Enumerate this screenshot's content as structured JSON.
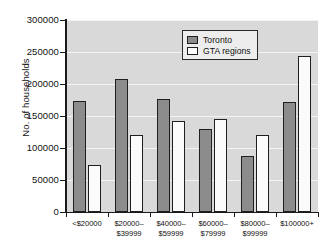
{
  "chart_data": {
    "type": "bar",
    "title": "",
    "subtitle": "",
    "xlabel": "",
    "ylabel": "No. of households",
    "ylim": [
      0,
      300000
    ],
    "ytick_labels": [
      "0",
      "50000",
      "100000",
      "150000",
      "200000",
      "250000",
      "300000"
    ],
    "ytick_values": [
      0,
      50000,
      100000,
      150000,
      200000,
      250000,
      300000
    ],
    "grid": true,
    "legend_position": "top-right",
    "categories": [
      "<$20000",
      "$20000–\n$39999",
      "$40000–\n$59999",
      "$60000–\n$79999",
      "$80000–\n$99999",
      "$100000+"
    ],
    "series": [
      {
        "name": "Toronto",
        "color": "#8c8c8c",
        "values": [
          174000,
          208000,
          176000,
          130000,
          87000,
          172000
        ]
      },
      {
        "name": "GTA regions",
        "color": "#fbfbfb",
        "values": [
          73000,
          121000,
          142000,
          146000,
          120000,
          243000
        ]
      }
    ]
  },
  "legend": {
    "items": [
      {
        "label": "Toronto",
        "swatch": "toronto"
      },
      {
        "label": "GTA regions",
        "swatch": "gta"
      }
    ]
  }
}
